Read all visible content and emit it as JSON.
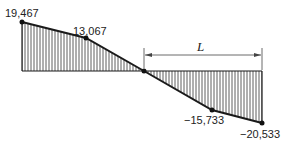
{
  "diagram": {
    "type": "shear-diagram",
    "values": {
      "v1": "19,467",
      "v2": "13,067",
      "v3": "−15,733",
      "v4": "−20,533"
    },
    "dimension_label": "L",
    "points": [
      {
        "x": 22,
        "y": 22,
        "value": 19467
      },
      {
        "x": 86,
        "y": 38,
        "value": 13067
      },
      {
        "x": 144,
        "y": 71,
        "value": 0
      },
      {
        "x": 212,
        "y": 110,
        "value": -15733
      },
      {
        "x": 262,
        "y": 123,
        "value": -20533
      }
    ],
    "baseline_y": 71,
    "colors": {
      "line": "#1a1a1a",
      "hatch": "#333333"
    }
  }
}
